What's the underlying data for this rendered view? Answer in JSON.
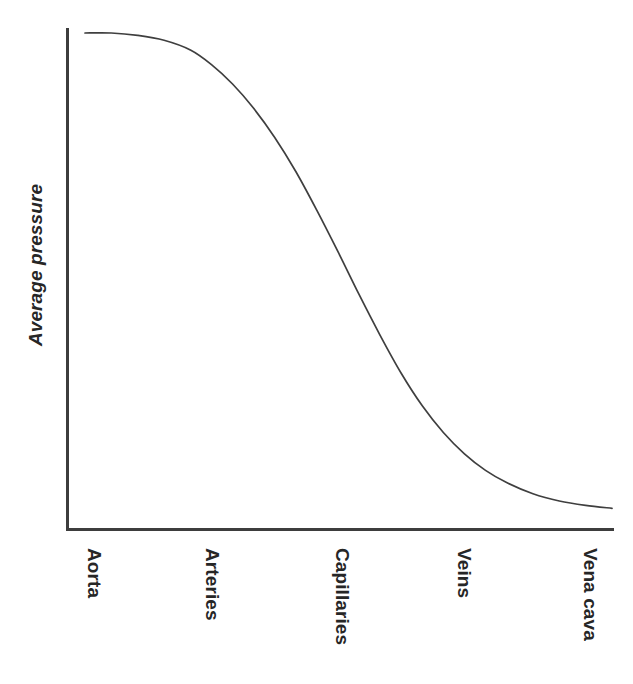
{
  "figure": {
    "background_color": "#ffffff",
    "line_color": "#3f3f3f",
    "axis_color": "#3d3d3d",
    "text_color": "#262626"
  },
  "axes": {
    "y_title": "Average pressure",
    "x_title": ""
  },
  "chart_data": {
    "type": "line",
    "title": "",
    "subtitle": "",
    "xlabel": "",
    "ylabel": "Average pressure",
    "grid": false,
    "legend": null,
    "axis_ticks": false,
    "tick_marks": false,
    "categories": [
      "Aorta",
      "Arteries",
      "Capillaries",
      "Veins",
      "Vena cava"
    ],
    "category_positions": [
      0.05,
      0.27,
      0.51,
      0.73,
      0.96
    ],
    "xlim": [
      0,
      1
    ],
    "ylim": [
      0,
      1
    ],
    "series": [
      {
        "name": "Average pressure",
        "description": "Mean blood pressure falls gradually through the aorta and large arteries, drops steeply across the arterioles and capillaries, then levels off near zero in the veins and vena cava.",
        "x": [
          0.0,
          0.05,
          0.1,
          0.15,
          0.2,
          0.24,
          0.28,
          0.32,
          0.36,
          0.4,
          0.44,
          0.48,
          0.52,
          0.56,
          0.6,
          0.64,
          0.68,
          0.72,
          0.76,
          0.8,
          0.85,
          0.9,
          0.95,
          1.0
        ],
        "y": [
          1.0,
          1.0,
          0.995,
          0.985,
          0.965,
          0.935,
          0.895,
          0.845,
          0.785,
          0.715,
          0.635,
          0.55,
          0.462,
          0.378,
          0.3,
          0.233,
          0.178,
          0.134,
          0.1,
          0.075,
          0.052,
          0.037,
          0.028,
          0.022
        ]
      }
    ],
    "annotations": []
  },
  "labels": {
    "x_ticks": [
      {
        "text": "Aorta",
        "center_x": 96
      },
      {
        "text": "Arteries",
        "center_x": 214
      },
      {
        "text": "Capillaries",
        "center_x": 344
      },
      {
        "text": "Veins",
        "center_x": 466
      },
      {
        "text": "Vena cava",
        "center_x": 592
      }
    ]
  }
}
